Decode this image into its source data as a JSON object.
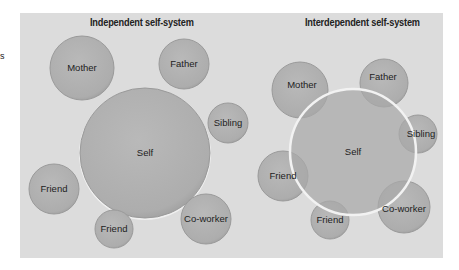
{
  "margin_text": "s",
  "colors": {
    "panel_bg": "#dcdcdc",
    "circle_fill": "#b0b0b0",
    "circle_edge": "#9a9a9a",
    "self_outline": "#f2f2f2",
    "overlap_fill": "#9e9e9e",
    "text": "#222222"
  },
  "panels": [
    {
      "title": "Independent self-system",
      "self": {
        "label": "Self",
        "cx": 145,
        "cy": 153,
        "r": 65
      },
      "others": [
        {
          "label": "Mother",
          "cx": 82,
          "cy": 68,
          "r": 32
        },
        {
          "label": "Father",
          "cx": 184,
          "cy": 64,
          "r": 25
        },
        {
          "label": "Sibling",
          "cx": 228,
          "cy": 123,
          "r": 20
        },
        {
          "label": "Friend",
          "cx": 54,
          "cy": 189,
          "r": 25
        },
        {
          "label": "Friend",
          "cx": 114,
          "cy": 229,
          "r": 19
        },
        {
          "label": "Co-worker",
          "cx": 206,
          "cy": 219,
          "r": 25
        }
      ]
    },
    {
      "title": "Interdependent self-system",
      "self": {
        "label": "Self",
        "cx": 353,
        "cy": 152,
        "r": 63
      },
      "others": [
        {
          "label": "Mother",
          "cx": 300,
          "cy": 90,
          "r": 28
        },
        {
          "label": "Father",
          "cx": 384,
          "cy": 83,
          "r": 24
        },
        {
          "label": "Sibling",
          "cx": 418,
          "cy": 134,
          "r": 19
        },
        {
          "label": "Friend",
          "cx": 283,
          "cy": 176,
          "r": 25
        },
        {
          "label": "Friend",
          "cx": 330,
          "cy": 220,
          "r": 19
        },
        {
          "label": "Co-worker",
          "cx": 404,
          "cy": 207,
          "r": 26
        }
      ]
    }
  ]
}
